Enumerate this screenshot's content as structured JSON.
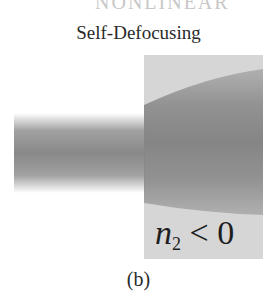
{
  "top_fragment": "NONLINEAR",
  "title": "Self-Defocusing",
  "label": {
    "var": "n",
    "subscript": "2",
    "relation": "< 0"
  },
  "caption": "(b)",
  "colors": {
    "medium": "#d6d6d6",
    "beam": "#888888",
    "text": "#2a2a2a"
  }
}
